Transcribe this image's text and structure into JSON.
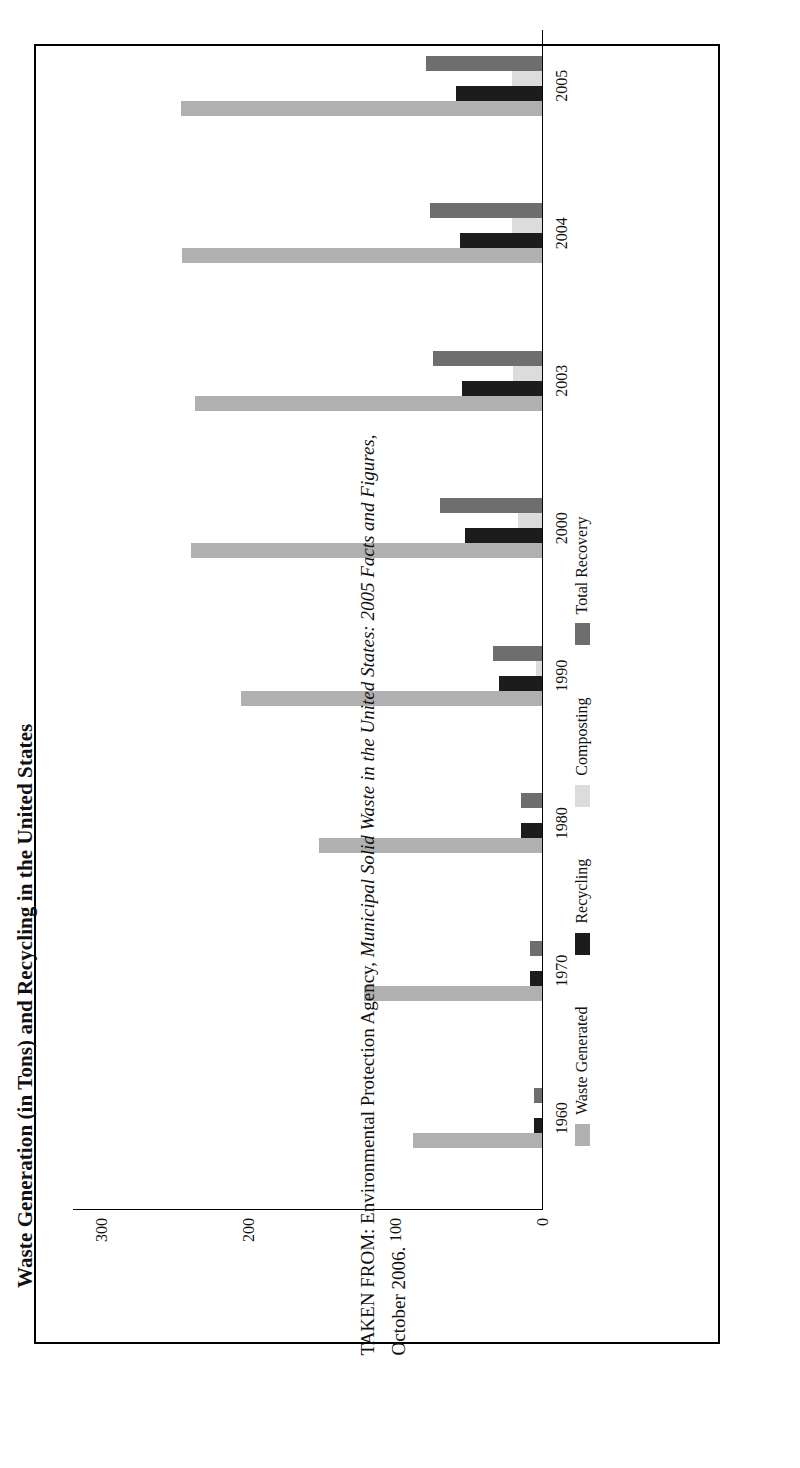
{
  "figure": {
    "title": "Waste Generation (in Tons) and Recycling in the United States"
  },
  "caption": {
    "prefix": "TAKEN FROM: Environmental Protection Agency, ",
    "source_italic": "Municipal Solid Waste in the United States: 2005 Facts and Figures",
    "suffix": ",",
    "line2": "October 2006."
  },
  "legend": {
    "items": [
      {
        "label": "Waste Generated",
        "color": "#b0b0b0",
        "key": "waste"
      },
      {
        "label": "Recycling",
        "color": "#1c1c1c",
        "key": "recycling"
      },
      {
        "label": "Composting",
        "color": "#dcdcdc",
        "key": "composting"
      },
      {
        "label": "Total Recovery",
        "color": "#6e6e6e",
        "key": "recovery"
      }
    ]
  },
  "axis": {
    "y_ticks": [
      "0",
      "100",
      "200",
      "300"
    ],
    "y_tick_values": [
      0,
      100,
      200,
      300
    ],
    "ylim": [
      0,
      320
    ],
    "x_ticks": [
      "1960",
      "1970",
      "1980",
      "1990",
      "2000",
      "2003",
      "2004",
      "2005"
    ]
  },
  "chart_data": {
    "type": "bar",
    "title": "Waste Generation (in Tons) and Recycling in the United States",
    "xlabel": "",
    "ylabel": "",
    "ylim": [
      0,
      320
    ],
    "grid": false,
    "legend_position": "bottom",
    "orientation": "vertical-bars-rotated-90ccw",
    "categories": [
      "1960",
      "1970",
      "1980",
      "1990",
      "2000",
      "2003",
      "2004",
      "2005"
    ],
    "series": [
      {
        "name": "Waste Generated",
        "color": "#b0b0b0",
        "values": [
          88.1,
          121.1,
          151.6,
          205.2,
          239.1,
          236.2,
          245.0,
          245.7
        ]
      },
      {
        "name": "Recycling",
        "color": "#1c1c1c",
        "values": [
          5.6,
          8.0,
          14.5,
          29.0,
          52.7,
          54.3,
          55.8,
          58.4
        ]
      },
      {
        "name": "Composting",
        "color": "#dcdcdc",
        "values": [
          0.0,
          0.0,
          0.0,
          4.2,
          16.5,
          20.0,
          20.5,
          20.6
        ]
      },
      {
        "name": "Total Recovery",
        "color": "#6e6e6e",
        "values": [
          5.6,
          8.0,
          14.5,
          33.2,
          69.2,
          74.3,
          76.3,
          79.0
        ]
      }
    ]
  }
}
